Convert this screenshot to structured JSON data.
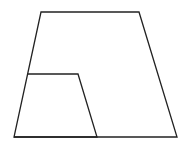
{
  "diagram": {
    "type": "geometry",
    "stroke_color": "#222222",
    "background": "#ffffff",
    "shapes": [
      {
        "name": "outer-trapezoid",
        "points": [
          [
            41,
            12
          ],
          [
            139,
            12
          ],
          [
            177,
            137
          ],
          [
            14,
            137
          ]
        ]
      },
      {
        "name": "inner-trapezoid",
        "points": [
          [
            28,
            74
          ],
          [
            78,
            74
          ],
          [
            97,
            137
          ],
          [
            14,
            137
          ]
        ]
      }
    ]
  }
}
